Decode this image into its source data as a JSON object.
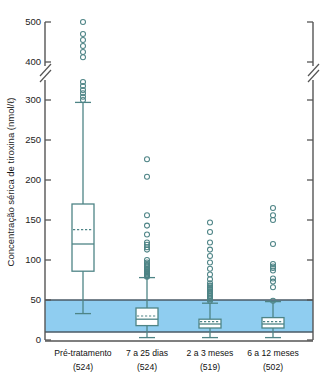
{
  "chart_data": {
    "type": "box",
    "title": "",
    "xlabel": "",
    "ylabel": "Concentração sérica de tiroxina (nmol/ℓ)",
    "ylabel_unit": "nmol/ℓ",
    "ylim": [
      0,
      500
    ],
    "axis_break": {
      "present": true,
      "between": [
        300,
        400
      ],
      "note": "eixo quebrado entre 300 e 400"
    },
    "y_ticks": [
      0,
      50,
      100,
      150,
      200,
      250,
      300,
      400,
      500
    ],
    "y_tick_labels": [
      "0",
      "50",
      "100",
      "150",
      "200",
      "250",
      "300",
      "400",
      "500"
    ],
    "grid": false,
    "legend": "none",
    "right_axis": true,
    "reference_band": {
      "label": "faixa de referência",
      "low": 10,
      "high": 50,
      "color": "#8fcdf0"
    },
    "colors": {
      "box_line": "#4e8486",
      "outlier": "#4e8486",
      "band_fill": "#8fcdf0",
      "band_edge": "#4a5a66",
      "axis": "#555555",
      "text": "#111111"
    },
    "categories": [
      "Pré-tratamento",
      "7 a 25 dias",
      "2 a 3 meses",
      "6 a 12 meses"
    ],
    "counts": [
      "(524)",
      "(524)",
      "(519)",
      "(502)"
    ],
    "n_values": [
      524,
      524,
      519,
      502
    ],
    "series": [
      {
        "name": "Pré-tratamento",
        "count": 524,
        "whisker_low": 33,
        "q1": 86,
        "median": 120,
        "mean": 138,
        "q3": 170,
        "whisker_high": 297,
        "outliers": [
          500,
          470,
          455,
          440,
          425,
          412,
          350,
          340,
          330,
          322,
          313,
          305
        ]
      },
      {
        "name": "7 a 25 dias",
        "count": 524,
        "whisker_low": 3,
        "q1": 18,
        "median": 26,
        "mean": 30,
        "q3": 40,
        "whisker_high": 78,
        "outliers": [
          226,
          204,
          156,
          143,
          132,
          122,
          119,
          116,
          113,
          100,
          97,
          95,
          93,
          91,
          89,
          88,
          87,
          86,
          85,
          84,
          83,
          82,
          81,
          80,
          79
        ]
      },
      {
        "name": "2 a 3 meses",
        "count": 519,
        "whisker_low": 3,
        "q1": 15,
        "median": 20,
        "mean": 23,
        "q3": 26,
        "whisker_high": 46,
        "outliers": [
          147,
          135,
          122,
          113,
          105,
          97,
          89,
          82,
          76,
          71,
          68,
          66,
          64,
          63,
          61,
          59,
          57,
          55,
          53,
          51,
          49
        ]
      },
      {
        "name": "6 a 12 meses",
        "count": 502,
        "whisker_low": 3,
        "q1": 15,
        "median": 20,
        "mean": 23,
        "q3": 28,
        "whisker_high": 48,
        "outliers": [
          165,
          156,
          150,
          120,
          95,
          92,
          90,
          87,
          77,
          73,
          66,
          49
        ]
      }
    ]
  }
}
